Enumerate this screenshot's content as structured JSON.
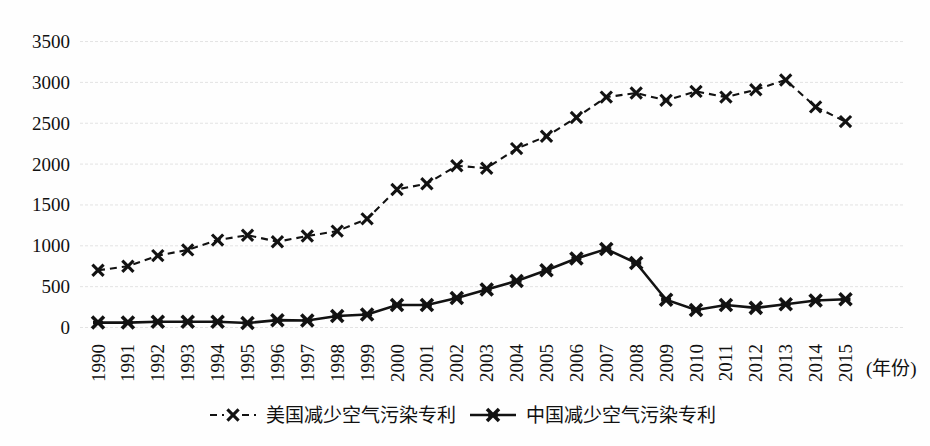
{
  "chart_data": {
    "type": "line",
    "title": "",
    "xlabel": "(年份)",
    "ylabel": "",
    "grid": true,
    "legend_position": "bottom",
    "ylim": [
      0,
      3500
    ],
    "ytick_values": [
      0,
      500,
      1000,
      1500,
      2000,
      2500,
      3000,
      3500
    ],
    "ytick_labels": [
      "0",
      "500",
      "1000",
      "1500",
      "2000",
      "2500",
      "3000",
      "3500"
    ],
    "categories": [
      "1990",
      "1991",
      "1992",
      "1993",
      "1994",
      "1995",
      "1996",
      "1997",
      "1998",
      "1999",
      "2000",
      "2001",
      "2002",
      "2003",
      "2004",
      "2005",
      "2006",
      "2007",
      "2008",
      "2009",
      "2010",
      "2011",
      "2012",
      "2013",
      "2014",
      "2015"
    ],
    "series": [
      {
        "name": "美国减少空气污染专利",
        "style": "dashed",
        "marker": "x",
        "color": "#121212",
        "values": [
          700,
          750,
          880,
          950,
          1070,
          1130,
          1050,
          1120,
          1180,
          1330,
          1690,
          1760,
          1980,
          1950,
          2190,
          2340,
          2570,
          2820,
          2870,
          2780,
          2890,
          2820,
          2910,
          3030,
          2700,
          2520
        ]
      },
      {
        "name": "中国减少空气污染专利",
        "style": "solid",
        "marker": "x",
        "color": "#121212",
        "values": [
          60,
          60,
          70,
          70,
          70,
          55,
          90,
          85,
          140,
          160,
          275,
          275,
          360,
          465,
          570,
          700,
          845,
          960,
          790,
          340,
          215,
          275,
          240,
          285,
          330,
          345
        ]
      }
    ]
  },
  "legend": {
    "items": [
      {
        "label": "美国减少空气污染专利",
        "style": "dashed"
      },
      {
        "label": "中国减少空气污染专利",
        "style": "solid"
      }
    ]
  },
  "axis": {
    "x_unit_label": "(年份)"
  }
}
